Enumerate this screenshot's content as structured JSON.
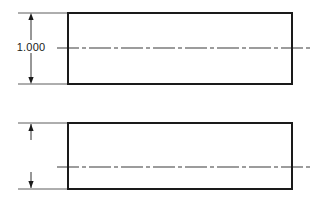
{
  "drawing": {
    "title": "Bar stock two-view engineering drawing",
    "background_color": "#ffffff",
    "line_color": "#1a1a1a",
    "centerline_color": "#3a3a3a",
    "thin_line_color": "#4a4a4a",
    "canvas": {
      "width": 322,
      "height": 200
    },
    "views": [
      {
        "name": "upper-view",
        "shape": "rectangle",
        "x": 68,
        "y": 13,
        "width": 224,
        "height": 71,
        "stroke_width": 1.6,
        "centerline": {
          "name": "horizontal-centerline",
          "y": 48,
          "x_start": 57,
          "x_end": 312,
          "dash_pattern": "22 3 4 3"
        },
        "dimension": {
          "name": "height-dimension",
          "label": "1.000",
          "label_x": 31,
          "label_y": 51,
          "line_x": 31,
          "top_y": 13,
          "bottom_y": 84,
          "arrow_direction": "outward",
          "extension_lines": [
            {
              "y": 13,
              "x_start": 18,
              "x_end": 70
            },
            {
              "y": 84,
              "x_start": 18,
              "x_end": 70
            }
          ],
          "has_label": true
        }
      },
      {
        "name": "lower-view",
        "shape": "rectangle",
        "x": 68,
        "y": 123,
        "width": 224,
        "height": 66,
        "stroke_width": 1.6,
        "centerline": {
          "name": "horizontal-centerline",
          "y": 167,
          "x_start": 57,
          "x_end": 312,
          "dash_pattern": "22 3 4 3"
        },
        "dimension": {
          "name": "height-dimension",
          "label": "",
          "label_x": 31,
          "label_y": 160,
          "line_x": 31,
          "top_y": 123,
          "bottom_y": 189,
          "arrow_direction": "inward",
          "extension_lines": [
            {
              "y": 123,
              "x_start": 18,
              "x_end": 70
            },
            {
              "y": 189,
              "x_start": 18,
              "x_end": 70
            }
          ],
          "has_label": false
        }
      }
    ]
  }
}
